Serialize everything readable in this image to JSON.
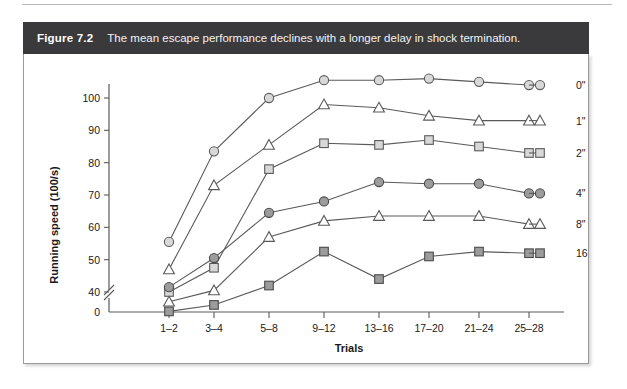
{
  "figure": {
    "number": "Figure 7.2",
    "caption": "The mean escape performance declines with a longer delay in shock termination."
  },
  "chart_data": {
    "type": "line",
    "title": "",
    "xlabel": "Trials",
    "ylabel": "Running speed (100/s)",
    "categories": [
      "1–2",
      "3–4",
      "5–8",
      "9–12",
      "13–16",
      "17–20",
      "21–24",
      "25–28"
    ],
    "ylim": [
      0,
      108
    ],
    "yticks": [
      40,
      50,
      60,
      70,
      80,
      90,
      100
    ],
    "y_zero_tick": "0",
    "axis_break": true,
    "grid": false,
    "legend_position": "right",
    "series": [
      {
        "name": "0\"",
        "marker": "open-circle",
        "values": [
          55.5,
          83.5,
          100.0,
          105.5,
          105.5,
          106.0,
          105.0,
          104.0
        ]
      },
      {
        "name": "1\"",
        "marker": "open-triangle",
        "values": [
          47.0,
          73.0,
          85.5,
          98.0,
          97.0,
          94.5,
          93.0,
          93.0
        ]
      },
      {
        "name": "2\"",
        "marker": "open-square",
        "values": [
          40.0,
          47.5,
          78.0,
          86.0,
          85.5,
          87.0,
          85.0,
          83.0
        ]
      },
      {
        "name": "4\"",
        "marker": "filled-circle",
        "values": [
          41.5,
          50.5,
          64.5,
          68.0,
          74.0,
          73.5,
          73.5,
          70.5
        ]
      },
      {
        "name": "8\"",
        "marker": "open-triangle",
        "values": [
          37.0,
          40.5,
          57.0,
          62.0,
          63.5,
          63.5,
          63.5,
          61.0
        ]
      },
      {
        "name": "16\"",
        "marker": "filled-square",
        "values": [
          34.0,
          36.0,
          42.0,
          52.5,
          44.0,
          51.0,
          52.5,
          52.0
        ]
      }
    ]
  }
}
